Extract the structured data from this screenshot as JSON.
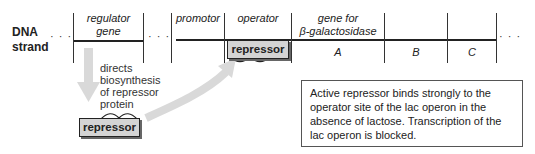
{
  "diagram": {
    "dna_label": [
      "DNA",
      "strand"
    ],
    "ellipsis": "· · ·",
    "segments": {
      "regulator_gene": [
        "regulator",
        "gene"
      ],
      "promotor": "promotor",
      "operator": "operator",
      "gene_for": [
        "gene for",
        "β-galactosidase"
      ],
      "A": "A",
      "B": "B",
      "C": "C"
    },
    "annotation": [
      "directs",
      "biosynthesis",
      "of repressor",
      "protein"
    ],
    "repressor_free": "repressor",
    "repressor_bound": "repressor",
    "note": "Active repressor binds strongly to the operator site of the lac operon in the absence of lactose. Transcription of the lac operon is blocked.",
    "colors": {
      "arrow": "#d9d9d9",
      "repressor_fill": "#d4d4d4",
      "line": "#222222"
    }
  }
}
